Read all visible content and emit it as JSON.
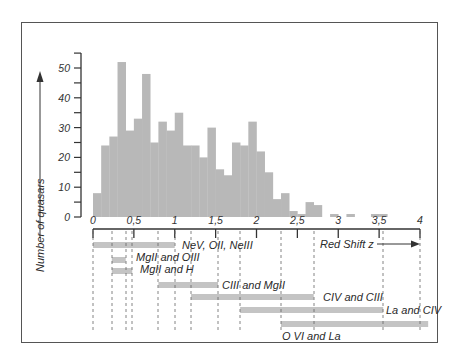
{
  "chart_data": {
    "type": "bar",
    "title": "",
    "xlabel": "Red Shift z",
    "ylabel": "Number of quasars",
    "xlim": [
      0,
      4
    ],
    "ylim": [
      0,
      55
    ],
    "bin_width": 0.1,
    "x_ticks": [
      "0",
      "0,5",
      "1",
      "1,5",
      "2",
      "2,5",
      "3",
      "3,5",
      "4"
    ],
    "y_ticks": [
      "0",
      "10",
      "20",
      "30",
      "40",
      "50"
    ],
    "bins_start": [
      0.0,
      0.1,
      0.2,
      0.3,
      0.4,
      0.5,
      0.6,
      0.7,
      0.8,
      0.9,
      1.0,
      1.1,
      1.2,
      1.3,
      1.4,
      1.5,
      1.6,
      1.7,
      1.8,
      1.9,
      2.0,
      2.1,
      2.2,
      2.3,
      2.4,
      2.5,
      2.6,
      2.7,
      2.8,
      2.9,
      3.0,
      3.1,
      3.2,
      3.3,
      3.4,
      3.5
    ],
    "values": [
      8,
      24,
      27,
      52,
      29,
      33,
      48,
      25,
      32,
      29,
      35,
      24,
      24,
      20,
      30,
      16,
      14,
      25,
      24,
      32,
      22,
      15,
      6,
      8,
      2,
      1,
      5,
      4,
      0,
      1,
      0,
      1,
      0,
      0,
      1,
      1
    ],
    "grid": false,
    "legend": null,
    "line_ranges": [
      {
        "label": "NeV, OII, NeIII",
        "z_start": 0.0,
        "z_end": 1.0
      },
      {
        "label": "MgII and OIII",
        "z_start": 0.23,
        "z_end": 0.4
      },
      {
        "label": "MgII and H",
        "z_start": 0.23,
        "z_end": 0.48
      },
      {
        "label": "CIII and MgII",
        "z_start": 0.8,
        "z_end": 1.53
      },
      {
        "label": "CIV and CIII",
        "z_start": 1.2,
        "z_end": 2.7
      },
      {
        "label": "La and CIV",
        "z_start": 1.8,
        "z_end": 3.55
      },
      {
        "label": "O VI and La",
        "z_start": 2.3,
        "z_end": 4.1
      }
    ],
    "colors": {
      "bars": "#b8b8b8",
      "ranges": "#c4c4c4",
      "axis": "#333333"
    }
  },
  "labels": {
    "y_axis": "Number of quasars",
    "x_axis": "Red Shift z"
  }
}
